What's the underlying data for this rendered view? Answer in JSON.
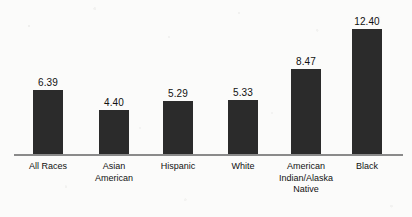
{
  "chart_data": {
    "type": "bar",
    "title": "",
    "subtitle": "",
    "xlabel": "",
    "ylabel": "",
    "grid": false,
    "legend": false,
    "axis_baseline_visible": true,
    "ylim": [
      0,
      13.5
    ],
    "categories": [
      "All Races",
      "Asian American",
      "Hispanic",
      "White",
      "American Indian/Alaska Native",
      "Black"
    ],
    "values": [
      6.39,
      4.4,
      5.29,
      5.33,
      8.47,
      12.4
    ],
    "value_labels": [
      "6.39",
      "4.40",
      "5.29",
      "5.33",
      "8.47",
      "12.40"
    ],
    "bars": [
      {
        "category": "All Races",
        "label_lines": [
          "All Races"
        ],
        "value": 6.39,
        "value_label": "6.39",
        "color": "#2b2b2b"
      },
      {
        "category": "Asian American",
        "label_lines": [
          "Asian",
          "American"
        ],
        "value": 4.4,
        "value_label": "4.40",
        "color": "#2b2b2b"
      },
      {
        "category": "Hispanic",
        "label_lines": [
          "Hispanic"
        ],
        "value": 5.29,
        "value_label": "5.29",
        "color": "#2b2b2b"
      },
      {
        "category": "White",
        "label_lines": [
          "White"
        ],
        "value": 5.33,
        "value_label": "5.33",
        "color": "#2b2b2b"
      },
      {
        "category": "American Indian/Alaska Native",
        "label_lines": [
          "American",
          "Indian/Alaska",
          "Native"
        ],
        "value": 8.47,
        "value_label": "8.47",
        "color": "#2b2b2b"
      },
      {
        "category": "Black",
        "label_lines": [
          "Black"
        ],
        "value": 12.4,
        "value_label": "12.40",
        "color": "#2b2b2b"
      }
    ],
    "colors": {
      "bar_fill": "#2b2b2b",
      "axis_line": "#8a8a8a",
      "background": "#fbfbfa",
      "text": "#111111"
    }
  },
  "layout": {
    "baseline_y": 154,
    "px_per_unit": 10.05,
    "bar_width": 30,
    "bar_left_positions": [
      33,
      99,
      163,
      228,
      291,
      352
    ]
  }
}
